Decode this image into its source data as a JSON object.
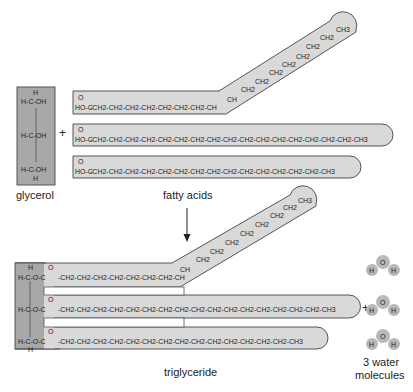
{
  "labels": {
    "glycerol": "glycerol",
    "fatty_acids": "fatty acids",
    "triglyceride": "triglyceride",
    "water_line1": "3 water",
    "water_line2": "molecules",
    "plus": "+"
  },
  "glycerol": {
    "top_h": "H",
    "rows": [
      "H-C-OH",
      "H-C-OH",
      "H-C-OH"
    ],
    "bottom_h": "H"
  },
  "fatty_acids": {
    "carbonyl_o": "O",
    "head": "HO-C",
    "acid1": {
      "name": "unsaturated (bent)",
      "straight": "-CH2-CH2-CH2-CH2-CH2-CH2-CH2-CH",
      "bent": [
        "CH",
        "CH2",
        "CH2",
        "CH2",
        "CH2",
        "CH2",
        "CH2",
        "CH2",
        "CH3"
      ]
    },
    "acid2": {
      "chain": "-CH2-CH2-CH2-CH2-CH2-CH2-CH2-CH2-CH2-CH2-CH2-CH2-CH2-CH2-CH2-CH2-CH3"
    },
    "acid3": {
      "chain": "-CH2-CH2-CH2-CH2-CH2-CH2-CH2-CH2-CH2-CH2-CH2-CH2-CH2-CH2-CH3"
    }
  },
  "triglyceride": {
    "top_h": "H",
    "rows": [
      "H-C-O-C",
      "H-C-O-C",
      "H-C-O-C"
    ],
    "bottom_h": "H"
  },
  "water": {
    "molecule": {
      "o": "O",
      "h_left": "H",
      "h_right": "H"
    },
    "count": 3
  },
  "colors": {
    "glycerol_fill": "#a8a8a8",
    "chain_fill": "#d9d9d9",
    "outline": "#555555",
    "water_fill": "#b8b8b8"
  }
}
